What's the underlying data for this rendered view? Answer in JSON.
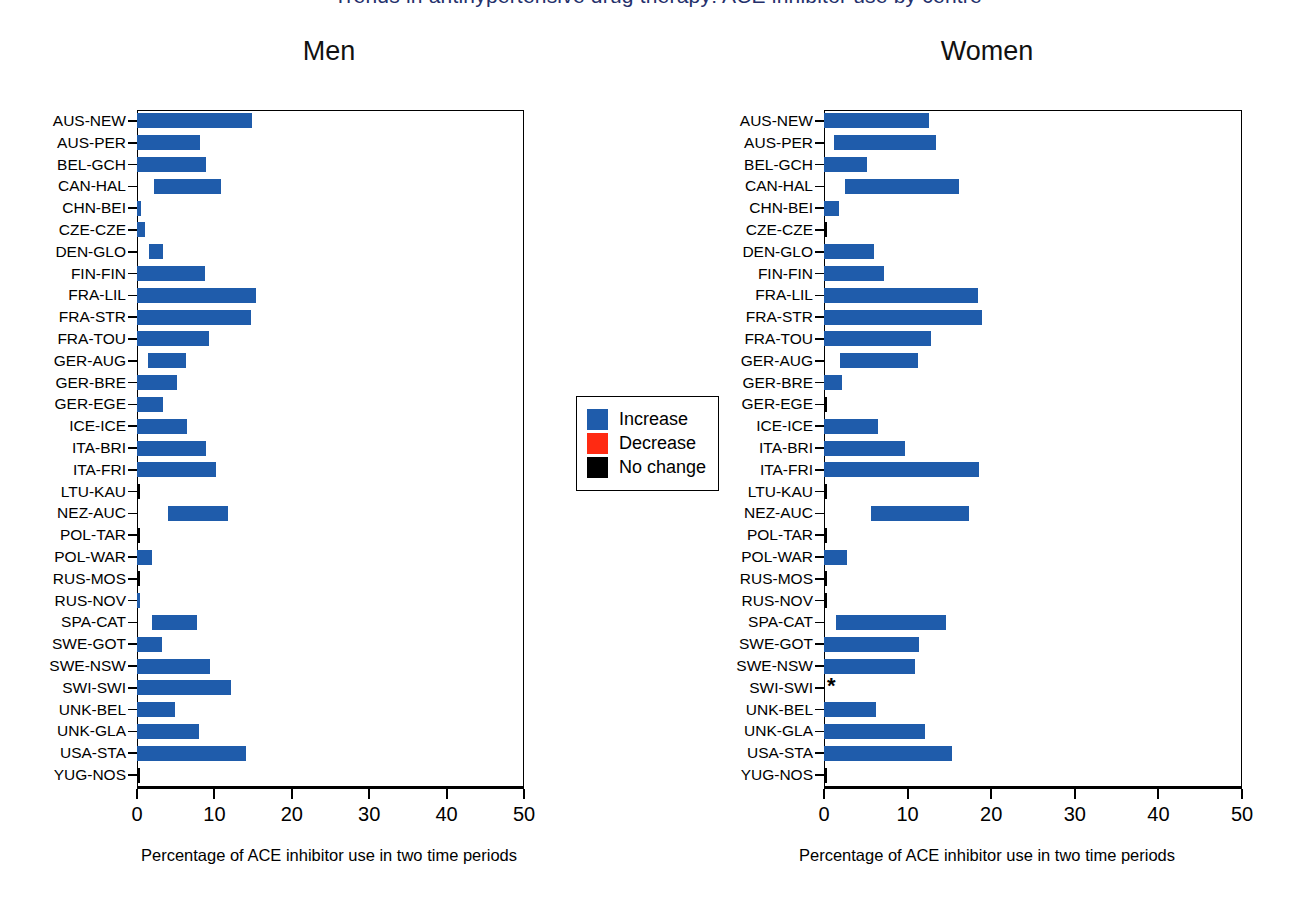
{
  "figure": {
    "cut_off_title": "Trends in antihypertensive drug therapy: ACE inhibitor use by centre",
    "xaxis_title": "Percentage of ACE inhibitor use in two time periods",
    "xticks": [
      0,
      10,
      20,
      30,
      40,
      50
    ],
    "colors": {
      "increase": "#1f5cab",
      "decrease": "#ff2a12",
      "no_change": "#000000"
    }
  },
  "legend": {
    "items": [
      {
        "label": "Increase",
        "color": "#1f5cab"
      },
      {
        "label": "Decrease",
        "color": "#ff2a12"
      },
      {
        "label": "No change",
        "color": "#000000"
      }
    ]
  },
  "panels": [
    {
      "title": "Men"
    },
    {
      "title": "Women"
    }
  ],
  "chart_data": {
    "type": "bar",
    "title": "Percentage of ACE inhibitor use in two time periods",
    "xlabel": "Percentage of ACE inhibitor use in two time periods",
    "ylabel": "",
    "xlim": [
      0,
      50
    ],
    "grid": false,
    "legend_position": "center",
    "orientation": "horizontal",
    "bar_style": "floating-range (start to end of two time periods)",
    "categories": [
      "AUS-NEW",
      "AUS-PER",
      "BEL-GCH",
      "CAN-HAL",
      "CHN-BEI",
      "CZE-CZE",
      "DEN-GLO",
      "FIN-FIN",
      "FRA-LIL",
      "FRA-STR",
      "FRA-TOU",
      "GER-AUG",
      "GER-BRE",
      "GER-EGE",
      "ICE-ICE",
      "ITA-BRI",
      "ITA-FRI",
      "LTU-KAU",
      "NEZ-AUC",
      "POL-TAR",
      "POL-WAR",
      "RUS-MOS",
      "RUS-NOV",
      "SPA-CAT",
      "SWE-GOT",
      "SWE-NSW",
      "SWI-SWI",
      "UNK-BEL",
      "UNK-GLA",
      "USA-STA",
      "YUG-NOS"
    ],
    "series": [
      {
        "name": "Men",
        "bars": [
          {
            "category": "AUS-NEW",
            "start": 0.0,
            "end": 14.8,
            "status": "increase"
          },
          {
            "category": "AUS-PER",
            "start": 0.0,
            "end": 8.2,
            "status": "increase"
          },
          {
            "category": "BEL-GCH",
            "start": 0.0,
            "end": 8.9,
            "status": "increase"
          },
          {
            "category": "CAN-HAL",
            "start": 2.2,
            "end": 10.9,
            "status": "increase"
          },
          {
            "category": "CHN-BEI",
            "start": 0.0,
            "end": 0.5,
            "status": "increase"
          },
          {
            "category": "CZE-CZE",
            "start": 0.0,
            "end": 1.0,
            "status": "increase"
          },
          {
            "category": "DEN-GLO",
            "start": 1.6,
            "end": 3.3,
            "status": "increase"
          },
          {
            "category": "FIN-FIN",
            "start": 0.0,
            "end": 8.8,
            "status": "increase"
          },
          {
            "category": "FRA-LIL",
            "start": 0.0,
            "end": 15.4,
            "status": "increase"
          },
          {
            "category": "FRA-STR",
            "start": 0.0,
            "end": 14.7,
            "status": "increase"
          },
          {
            "category": "FRA-TOU",
            "start": 0.0,
            "end": 9.3,
            "status": "increase"
          },
          {
            "category": "GER-AUG",
            "start": 1.4,
            "end": 6.3,
            "status": "increase"
          },
          {
            "category": "GER-BRE",
            "start": 0.0,
            "end": 5.2,
            "status": "increase"
          },
          {
            "category": "GER-EGE",
            "start": 0.0,
            "end": 3.3,
            "status": "increase"
          },
          {
            "category": "ICE-ICE",
            "start": 0.0,
            "end": 6.5,
            "status": "increase"
          },
          {
            "category": "ITA-BRI",
            "start": 0.0,
            "end": 8.9,
            "status": "increase"
          },
          {
            "category": "ITA-FRI",
            "start": 0.0,
            "end": 10.2,
            "status": "increase"
          },
          {
            "category": "LTU-KAU",
            "start": 0.0,
            "end": 0.0,
            "status": "no_change"
          },
          {
            "category": "NEZ-AUC",
            "start": 4.0,
            "end": 11.7,
            "status": "increase"
          },
          {
            "category": "POL-TAR",
            "start": 0.0,
            "end": 0.0,
            "status": "no_change"
          },
          {
            "category": "POL-WAR",
            "start": 0.0,
            "end": 2.0,
            "status": "increase"
          },
          {
            "category": "RUS-MOS",
            "start": 0.0,
            "end": 0.0,
            "status": "no_change"
          },
          {
            "category": "RUS-NOV",
            "start": 0.0,
            "end": 0.3,
            "status": "increase"
          },
          {
            "category": "SPA-CAT",
            "start": 1.9,
            "end": 7.7,
            "status": "increase"
          },
          {
            "category": "SWE-GOT",
            "start": 0.0,
            "end": 3.2,
            "status": "increase"
          },
          {
            "category": "SWE-NSW",
            "start": 0.0,
            "end": 9.4,
            "status": "increase"
          },
          {
            "category": "SWI-SWI",
            "start": 0.0,
            "end": 12.1,
            "status": "increase"
          },
          {
            "category": "UNK-BEL",
            "start": 0.0,
            "end": 4.9,
            "status": "increase"
          },
          {
            "category": "UNK-GLA",
            "start": 0.0,
            "end": 8.0,
            "status": "increase"
          },
          {
            "category": "USA-STA",
            "start": 0.0,
            "end": 14.1,
            "status": "increase"
          },
          {
            "category": "YUG-NOS",
            "start": 0.0,
            "end": 0.0,
            "status": "no_change"
          }
        ]
      },
      {
        "name": "Women",
        "bars": [
          {
            "category": "AUS-NEW",
            "start": 0.0,
            "end": 12.6,
            "status": "increase"
          },
          {
            "category": "AUS-PER",
            "start": 1.2,
            "end": 13.4,
            "status": "increase"
          },
          {
            "category": "BEL-GCH",
            "start": 0.0,
            "end": 5.1,
            "status": "increase"
          },
          {
            "category": "CAN-HAL",
            "start": 2.5,
            "end": 16.1,
            "status": "increase"
          },
          {
            "category": "CHN-BEI",
            "start": 0.0,
            "end": 1.8,
            "status": "increase"
          },
          {
            "category": "CZE-CZE",
            "start": 0.0,
            "end": 0.0,
            "status": "no_change"
          },
          {
            "category": "DEN-GLO",
            "start": 0.0,
            "end": 6.0,
            "status": "increase"
          },
          {
            "category": "FIN-FIN",
            "start": 0.0,
            "end": 7.2,
            "status": "increase"
          },
          {
            "category": "FRA-LIL",
            "start": 0.0,
            "end": 18.4,
            "status": "increase"
          },
          {
            "category": "FRA-STR",
            "start": 0.0,
            "end": 18.9,
            "status": "increase"
          },
          {
            "category": "FRA-TOU",
            "start": 0.0,
            "end": 12.8,
            "status": "increase"
          },
          {
            "category": "GER-AUG",
            "start": 1.9,
            "end": 11.3,
            "status": "increase"
          },
          {
            "category": "GER-BRE",
            "start": 0.0,
            "end": 2.2,
            "status": "increase"
          },
          {
            "category": "GER-EGE",
            "start": 0.0,
            "end": 0.0,
            "status": "no_change"
          },
          {
            "category": "ICE-ICE",
            "start": 0.0,
            "end": 6.4,
            "status": "increase"
          },
          {
            "category": "ITA-BRI",
            "start": 0.0,
            "end": 9.7,
            "status": "increase"
          },
          {
            "category": "ITA-FRI",
            "start": 0.0,
            "end": 18.5,
            "status": "increase"
          },
          {
            "category": "LTU-KAU",
            "start": 0.0,
            "end": 0.0,
            "status": "no_change"
          },
          {
            "category": "NEZ-AUC",
            "start": 5.6,
            "end": 17.3,
            "status": "increase"
          },
          {
            "category": "POL-TAR",
            "start": 0.0,
            "end": 0.0,
            "status": "no_change"
          },
          {
            "category": "POL-WAR",
            "start": 0.0,
            "end": 2.8,
            "status": "increase"
          },
          {
            "category": "RUS-MOS",
            "start": 0.0,
            "end": 0.0,
            "status": "no_change"
          },
          {
            "category": "RUS-NOV",
            "start": 0.0,
            "end": 0.0,
            "status": "no_change"
          },
          {
            "category": "SPA-CAT",
            "start": 1.4,
            "end": 14.6,
            "status": "increase"
          },
          {
            "category": "SWE-GOT",
            "start": 0.0,
            "end": 11.4,
            "status": "increase"
          },
          {
            "category": "SWE-NSW",
            "start": 0.0,
            "end": 10.9,
            "status": "increase"
          },
          {
            "category": "SWI-SWI",
            "start": 0.0,
            "end": 0.0,
            "status": "not_available",
            "marker": "*"
          },
          {
            "category": "UNK-BEL",
            "start": 0.0,
            "end": 6.2,
            "status": "increase"
          },
          {
            "category": "UNK-GLA",
            "start": 0.0,
            "end": 12.1,
            "status": "increase"
          },
          {
            "category": "USA-STA",
            "start": 0.0,
            "end": 15.3,
            "status": "increase"
          },
          {
            "category": "YUG-NOS",
            "start": 0.0,
            "end": 0.0,
            "status": "no_change"
          }
        ]
      }
    ]
  }
}
